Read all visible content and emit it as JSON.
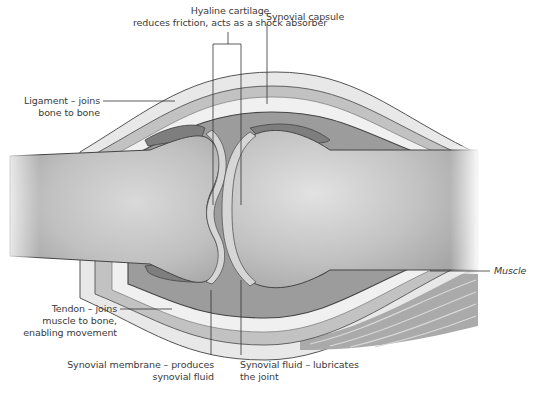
{
  "figure": {
    "colors": {
      "background": "#ffffff",
      "bone": "#b8b8b8",
      "bone_highlight": "#dcdcdc",
      "capsule_outer": "#e9e9e9",
      "capsule_band": "#bdbdbd",
      "synovial_fluid": "#9a9a9a",
      "cartilage": "#d2d2d2",
      "outline": "#4a4a4a",
      "muscle": "#a9a9a9",
      "leader_line": "#333333",
      "text": "#3a3a3a"
    }
  },
  "labels": {
    "hyaline_cartilage": {
      "line1": "Hyaline cartilage",
      "line2": "reduces friction, acts as a shock absorber"
    },
    "synovial_capsule": {
      "line1": "Synovial capsule"
    },
    "ligament": {
      "line1": "Ligament – joins",
      "line2": "bone to bone"
    },
    "tendon": {
      "line1": "Tendon – joins",
      "line2": "muscle to bone,",
      "line3": "enabling movement"
    },
    "synovial_membrane": {
      "line1": "Synovial membrane – produces",
      "line2": "synovial fluid"
    },
    "synovial_fluid": {
      "line1": "Synovial fluid – lubricates",
      "line2": "the joint"
    },
    "muscle": {
      "line1": "Muscle"
    }
  }
}
